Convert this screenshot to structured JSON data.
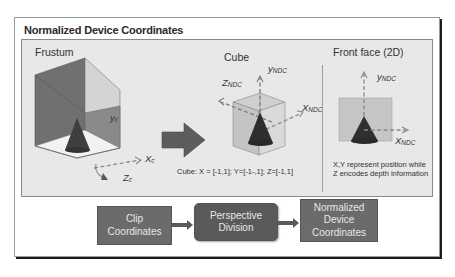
{
  "title": "Normalized Device Coordinates",
  "sections": {
    "frustum": {
      "label": "Frustum",
      "axes": {
        "y": {
          "base": "y",
          "sub": "c"
        },
        "x": {
          "base": "X",
          "sub": "c"
        },
        "z": {
          "base": "Z",
          "sub": "c"
        }
      }
    },
    "cube": {
      "label": "Cube",
      "axes": {
        "y": {
          "base": "y",
          "sub": "NDC"
        },
        "x": {
          "base": "X",
          "sub": "NDC"
        },
        "z": {
          "base": "Z",
          "sub": "NDC"
        }
      },
      "caption": "Cube: X = [-1,1]; Y=[-1-,1]; Z=[-1,1]"
    },
    "front_face": {
      "label": "Front face (2D)",
      "axes": {
        "y": {
          "base": "y",
          "sub": "NDC"
        },
        "x": {
          "base": "X",
          "sub": "NDC"
        }
      },
      "caption_lines": [
        "X,Y represent position while",
        "Z encodes depth information"
      ]
    }
  },
  "flow": {
    "steps": [
      {
        "lines": [
          "Clip",
          "Coordinates"
        ]
      },
      {
        "lines": [
          "Perspective",
          "Division"
        ]
      },
      {
        "lines": [
          "Normalized",
          "Device",
          "Coordinates"
        ]
      }
    ]
  },
  "colors": {
    "panel_bg": "#e8e8e8",
    "frustum_face": "#6e6e6e",
    "cone": "#3a3a3a",
    "flow_box": "#6b6b6b",
    "flow_box_center": "#5a5a5a",
    "arrow": "#5c5c5c"
  }
}
